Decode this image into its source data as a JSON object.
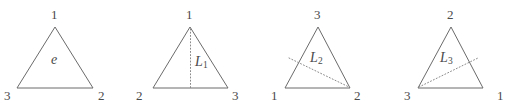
{
  "figure": {
    "stroke_color": "#6b6b6b",
    "dashed_color": "#8a8a8a",
    "text_color": "#4a4a4a",
    "background": "#ffffff",
    "panels": [
      {
        "id": "panel-1",
        "interior_label": "e",
        "interior_sub": "",
        "vertices": [
          {
            "label": "1",
            "position": "top"
          },
          {
            "label": "3",
            "position": "bottom-left"
          },
          {
            "label": "2",
            "position": "bottom-right"
          }
        ],
        "has_mirror_line": false
      },
      {
        "id": "panel-2",
        "interior_label": "L",
        "interior_sub": "1",
        "vertices": [
          {
            "label": "1",
            "position": "top"
          },
          {
            "label": "2",
            "position": "bottom-left"
          },
          {
            "label": "3",
            "position": "bottom-right"
          }
        ],
        "has_mirror_line": true,
        "mirror_from": "top-vertex",
        "mirror_to": "bottom-edge-midpoint"
      },
      {
        "id": "panel-3",
        "interior_label": "L",
        "interior_sub": "2",
        "vertices": [
          {
            "label": "3",
            "position": "top"
          },
          {
            "label": "1",
            "position": "bottom-left"
          },
          {
            "label": "2",
            "position": "bottom-right"
          }
        ],
        "has_mirror_line": true,
        "mirror_from": "left-edge-midpoint",
        "mirror_to": "bottom-right-vertex"
      },
      {
        "id": "panel-4",
        "interior_label": "L",
        "interior_sub": "3",
        "vertices": [
          {
            "label": "2",
            "position": "top"
          },
          {
            "label": "3",
            "position": "bottom-left"
          },
          {
            "label": "1",
            "position": "bottom-right"
          }
        ],
        "has_mirror_line": true,
        "mirror_from": "bottom-left-vertex",
        "mirror_to": "right-edge-midpoint"
      }
    ]
  }
}
